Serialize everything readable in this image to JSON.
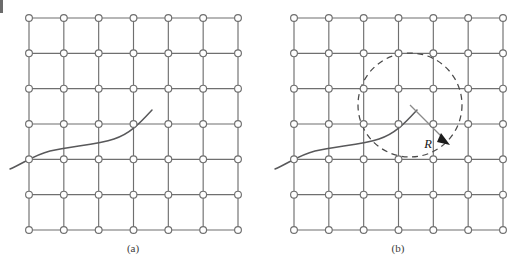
{
  "figure": {
    "title": "",
    "background_color": "#ffffff",
    "width": 525,
    "height": 268,
    "panels": [
      {
        "id": "panel-a",
        "caption": "(a)",
        "caption_x": 133,
        "caption_y": 252,
        "grid": {
          "columns": 7,
          "rows": 7,
          "x0": 29,
          "y0": 18,
          "x1": 238,
          "y1": 230,
          "line_color": "#6f6f6f",
          "node_fill": "#ffffff",
          "node_stroke": "#6f6f6f",
          "node_radius": 3.4
        },
        "curve": {
          "name": "boundary-curve",
          "color": "#58585a",
          "path": "M 10 169 C 22 164 34 155 50 151 C 70 146 96 145 114 139 C 130 134 140 123 152 110"
        },
        "has_radius_circle": false
      },
      {
        "id": "panel-b",
        "caption": "(b)",
        "caption_x": 398,
        "caption_y": 252,
        "grid": {
          "columns": 7,
          "rows": 7,
          "x0": 294,
          "y0": 18,
          "x1": 503,
          "y1": 230,
          "line_color": "#6f6f6f",
          "node_fill": "#ffffff",
          "node_stroke": "#6f6f6f",
          "node_radius": 3.4
        },
        "curve": {
          "name": "boundary-curve",
          "color": "#58585a",
          "path": "M 275 169 C 287 164 299 155 315 151 C 335 146 361 145 379 139 C 395 134 405 123 417 110"
        },
        "has_radius_circle": true,
        "radius_circle": {
          "name": "radius-circle",
          "center_x": 410,
          "center_y": 105,
          "radius": 52,
          "stroke": "#4a4a4a",
          "dash": "6 4.5"
        },
        "radius_indicator": {
          "label": "R",
          "label_x": 437,
          "label_y": 147,
          "line_from_x": 410,
          "line_from_y": 105,
          "line_to_x": 447,
          "line_to_y": 142,
          "arrow_color": "#1c1c1c",
          "line_color": "#8a8a8a"
        }
      }
    ],
    "artifacts": [
      {
        "name": "scan-artifact",
        "x": 0,
        "y": 0,
        "width": 3,
        "height": 13,
        "color": "#6b6b6b"
      }
    ]
  }
}
